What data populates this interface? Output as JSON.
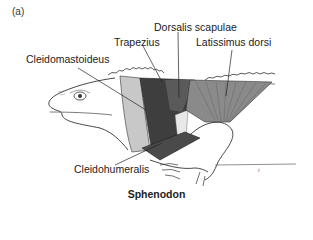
{
  "figure": {
    "panel_label": "(a)",
    "caption": "Sphenodon",
    "labels": {
      "dorsalis_scapulae": "Dorsalis scapulae",
      "trapezius": "Trapezius",
      "latissimus_dorsi": "Latissimus dorsi",
      "cleidomastoideus": "Cleidomastoideus",
      "cleidohumeralis": "Cleidohumeralis"
    },
    "colors": {
      "line": "#333333",
      "dark_muscle": "#3a3a3a",
      "mid_muscle": "#6a6a6a",
      "light_muscle": "#a8a8a8",
      "background": "#ffffff"
    }
  }
}
